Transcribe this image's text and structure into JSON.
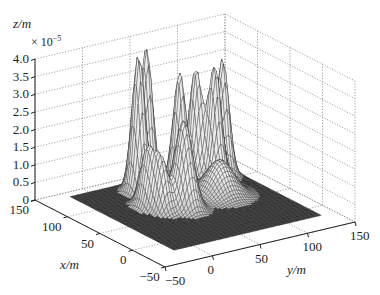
{
  "chart_data": {
    "type": "surface3d",
    "title": "",
    "xlabel": "x/m",
    "ylabel": "y/m",
    "zlabel": "z/m",
    "z_scale_label": "× 10",
    "z_scale_exponent": "−5",
    "xlim": [
      -50,
      150
    ],
    "ylim": [
      -50,
      150
    ],
    "zlim": [
      0,
      4.0
    ],
    "x_ticks": [
      "150",
      "100",
      "50",
      "0",
      "−50"
    ],
    "y_ticks": [
      "−50",
      "0",
      "50",
      "100",
      "150"
    ],
    "z_ticks": [
      "0",
      "0.5",
      "1.0",
      "1.5",
      "2.0",
      "2.5",
      "3.0",
      "3.5",
      "4.0"
    ],
    "grid": true,
    "colormap": "gray",
    "peaks": [
      {
        "x": 80,
        "y": 20,
        "height": 1.6,
        "sx": 8,
        "sy": 5
      },
      {
        "x": 65,
        "y": 25,
        "height": 1.4,
        "sx": 8,
        "sy": 5
      },
      {
        "x": 60,
        "y": 45,
        "height": 2.5,
        "sx": 10,
        "sy": 7
      },
      {
        "x": 115,
        "y": 35,
        "height": 3.9,
        "sx": 7,
        "sy": 5
      },
      {
        "x": 125,
        "y": 50,
        "height": 3.9,
        "sx": 7,
        "sy": 5
      },
      {
        "x": 110,
        "y": 75,
        "height": 3.2,
        "sx": 7,
        "sy": 5
      },
      {
        "x": 115,
        "y": 95,
        "height": 3.1,
        "sx": 7,
        "sy": 5
      },
      {
        "x": 100,
        "y": 105,
        "height": 3.2,
        "sx": 7,
        "sy": 5
      },
      {
        "x": 110,
        "y": 120,
        "height": 3.3,
        "sx": 7,
        "sy": 5
      },
      {
        "x": 70,
        "y": 90,
        "height": 1.0,
        "sx": 14,
        "sy": 12
      }
    ]
  },
  "axes": {
    "z_label": "z/m",
    "z_scale": "× 10",
    "z_scale_exp": "−5",
    "x_label": "x/m",
    "y_label": "y/m"
  }
}
